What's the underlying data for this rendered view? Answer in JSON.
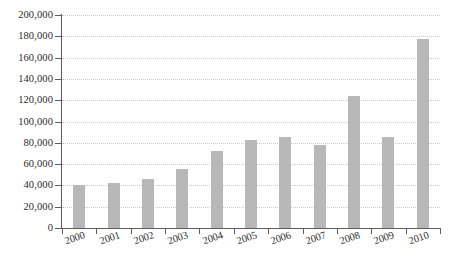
{
  "chart_data": {
    "type": "bar",
    "title": "",
    "subtitle": "",
    "xlabel": "",
    "ylabel": "",
    "categories": [
      "2000",
      "2001",
      "2002",
      "2003",
      "2004",
      "2005",
      "2006",
      "2007",
      "2008",
      "2009",
      "2010"
    ],
    "values": [
      40000,
      42000,
      46000,
      55000,
      72000,
      83000,
      85000,
      78000,
      124000,
      85000,
      177000
    ],
    "series": [
      {
        "name": "",
        "values": [
          40000,
          42000,
          46000,
          55000,
          72000,
          83000,
          85000,
          78000,
          124000,
          85000,
          177000
        ]
      }
    ],
    "ylim": [
      0,
      200000
    ],
    "ytick_values": [
      0,
      20000,
      40000,
      60000,
      80000,
      100000,
      120000,
      140000,
      160000,
      180000,
      200000
    ],
    "ytick_labels": [
      "0",
      "20,000",
      "40,000",
      "60,000",
      "80,000",
      "100,000",
      "120,000",
      "140,000",
      "160,000",
      "180,000",
      "200,000"
    ],
    "xtick_labels": [
      "2000",
      "2001",
      "2002",
      "2003",
      "2004",
      "2005",
      "2006",
      "2007",
      "2008",
      "2009",
      "2010"
    ],
    "grid": true,
    "grid_axis": "y",
    "grid_style": "dotted",
    "legend": false,
    "legend_position": "none",
    "annotations": [],
    "colors": {
      "bar": "#b8b8b8",
      "gridline": "#c9c9c9",
      "axis": "#5d5d5d",
      "text": "#2b2b2b",
      "background": "#ffffff"
    },
    "xlabel_rotation": -19
  }
}
